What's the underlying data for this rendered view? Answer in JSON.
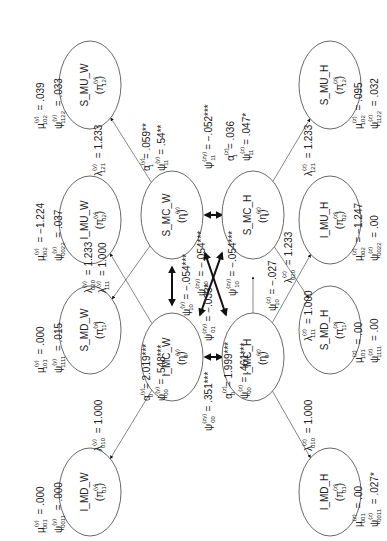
{
  "nodes": {
    "S_MU_W": {
      "name": "S_MU_W",
      "sym": "π",
      "sup": "(y)",
      "sub": "12"
    },
    "I_MU_W": {
      "name": "I_MU_W",
      "sym": "π",
      "sup": "(y)",
      "sub": "02"
    },
    "S_MD_W": {
      "name": "S_MD_W",
      "sym": "π",
      "sup": "(y)",
      "sub": "11"
    },
    "I_MD_W": {
      "name": "I_MD_W",
      "sym": "π",
      "sup": "(y)",
      "sub": "01"
    },
    "S_MC_W": {
      "name": "S_MC_W",
      "sym": "η",
      "sup": "(y)",
      "sub": "1"
    },
    "I_MC_W": {
      "name": "I_MC_W",
      "sym": "η",
      "sup": "(y)",
      "sub": "0"
    },
    "S_MC_H": {
      "name": "S_MC_H",
      "sym": "η",
      "sup": "(z)",
      "sub": "1"
    },
    "I_MC_H": {
      "name": "I_MC_H",
      "sym": "η",
      "sup": "(z)",
      "sub": "0"
    },
    "S_MU_H": {
      "name": "S_MU_H",
      "sym": "π",
      "sup": "(z)",
      "sub": "12"
    },
    "I_MU_H": {
      "name": "I_MU_H",
      "sym": "π",
      "sup": "(z)",
      "sub": "02"
    },
    "S_MD_H": {
      "name": "S_MD_H",
      "sym": "π",
      "sup": "(z)",
      "sub": "11"
    },
    "I_MD_H": {
      "name": "I_MD_H",
      "sym": "π",
      "sup": "(z)",
      "sub": "01"
    }
  },
  "params": {
    "mu_102_y": {
      "sym": "μ",
      "sup": "(y)",
      "sub": "102",
      "val": "= .039"
    },
    "psi_1122_y": {
      "sym": "ψ",
      "sup": "(y)",
      "sub": "1122",
      "val": "= .033"
    },
    "mu_002_y": {
      "sym": "μ",
      "sup": "(y)",
      "sub": "002",
      "val": "= −1.224"
    },
    "psi_0022_y": {
      "sym": "ψ",
      "sup": "(y)",
      "sub": "0022",
      "val": "= .037"
    },
    "mu_101_y": {
      "sym": "μ",
      "sup": "(y)",
      "sub": "101",
      "val": "= .000"
    },
    "psi_1111_y": {
      "sym": "ψ",
      "sup": "(y)",
      "sub": "1111",
      "val": "= .015"
    },
    "mu_001_y": {
      "sym": "μ",
      "sup": "(y)",
      "sub": "001",
      "val": "= .000"
    },
    "psi_0011_y": {
      "sym": "ψ",
      "sup": "(y)",
      "sub": "0011",
      "val": "= .000"
    },
    "lambda_121_y": {
      "sym": "λ",
      "sup": "(y)",
      "sub": "121",
      "val": "= 1.233"
    },
    "lambda_020_y": {
      "sym": "λ",
      "sup": "(y)",
      "sub": "020",
      "val": "= 1.233"
    },
    "lambda_111_y": {
      "sym": "λ",
      "sup": "(y)",
      "sub": "111",
      "val": "= 1.000"
    },
    "lambda_010_y": {
      "sym": "λ",
      "sup": "(y)",
      "sub": "010",
      "val": "= 1.000"
    },
    "alpha_1_y": {
      "sym": "α",
      "sup": "(y)",
      "sub": "1",
      "val": "= .059**"
    },
    "psi_11_y": {
      "sym": "ψ",
      "sup": "(y)",
      "sub": "11",
      "val": "= .54**"
    },
    "psi_10_y": {
      "sym": "ψ",
      "sup": "(y)",
      "sub": "10",
      "val": "= −.054***"
    },
    "alpha_0_y": {
      "sym": "α",
      "sup": "(y)",
      "sub": "0",
      "val": "= 2.019***"
    },
    "psi_00_y": {
      "sym": "ψ",
      "sup": "(y)",
      "sub": "00",
      "val": "= .548***"
    },
    "psi_11_zy": {
      "sym": "ψ",
      "sup": "(zy)",
      "sub": "11",
      "val": "= −.052***"
    },
    "psi_10_zy_a": {
      "sym": "ψ",
      "sup": "(zy)",
      "sub": "10",
      "val": "= −.054***"
    },
    "psi_10_zy_b": {
      "sym": "ψ",
      "sup": "(zy)",
      "sub": "10",
      "val": "= −.054***"
    },
    "psi_01_zy": {
      "sym": "ψ",
      "sup": "(zy)",
      "sub": "01",
      "val": "= −.033*"
    },
    "psi_00_zy": {
      "sym": "ψ",
      "sup": "(zy)",
      "sub": "00",
      "val": "= .351***"
    },
    "alpha_1_z": {
      "sym": "α",
      "sup": "(z)",
      "sub": "1",
      "val": "= .036"
    },
    "psi_11_z": {
      "sym": "ψ",
      "sup": "(z)",
      "sub": "11",
      "val": "= .047*"
    },
    "psi_10_z": {
      "sym": "ψ",
      "sup": "(z)",
      "sub": "10",
      "val": "= −.027"
    },
    "alpha_0_z": {
      "sym": "α",
      "sup": "(z)",
      "sub": "0",
      "val": "= 1.999***"
    },
    "psi_00_z": {
      "sym": "ψ",
      "sup": "(z)",
      "sub": "00",
      "val": "= .461***"
    },
    "lambda_121_z": {
      "sym": "λ",
      "sup": "(z)",
      "sub": "121",
      "val": "= 1.233"
    },
    "lambda_020_z": {
      "sym": "λ",
      "sup": "(z)",
      "sub": "020",
      "val": "= 1.233"
    },
    "lambda_111_z": {
      "sym": "λ",
      "sup": "(z)",
      "sub": "111",
      "val": "= 1.000"
    },
    "lambda_010_z": {
      "sym": "λ",
      "sup": "(z)",
      "sub": "010",
      "val": "= 1.000"
    },
    "mu_102_z": {
      "sym": "μ",
      "sup": "(z)",
      "sub": "102",
      "val": "= .095"
    },
    "psi_1122_z": {
      "sym": "ψ",
      "sup": "(z)",
      "sub": "1122",
      "val": "= .032"
    },
    "mu_002_z": {
      "sym": "μ",
      "sup": "(z)",
      "sub": "002",
      "val": "= −1.247"
    },
    "psi_0022_z": {
      "sym": "ψ",
      "sup": "(z)",
      "sub": "0022",
      "val": "= .00"
    },
    "mu_101_z": {
      "sym": "μ",
      "sup": "(z)",
      "sub": "101",
      "val": "= .00"
    },
    "psi_1111_z": {
      "sym": "ψ",
      "sup": "(z)",
      "sub": "1111",
      "val": "= .00"
    },
    "mu_001_z": {
      "sym": "μ",
      "sup": "(z)",
      "sub": "001",
      "val": "= .00"
    },
    "psi_0011_z": {
      "sym": "ψ",
      "sup": "(z)",
      "sub": "0011",
      "val": "= .027*"
    }
  }
}
